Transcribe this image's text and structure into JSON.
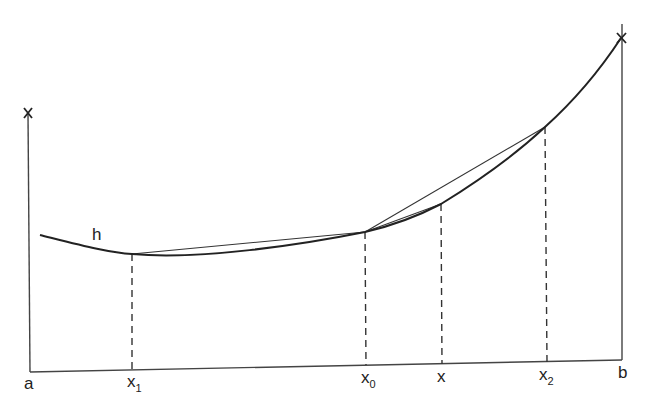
{
  "diagram": {
    "curve_label": "h",
    "y_axis_label": "x",
    "x_labels": {
      "a": "a",
      "x1_base": "x",
      "x1_sub": "1",
      "x0_base": "x",
      "x0_sub": "0",
      "x": "x",
      "x2_base": "x",
      "x2_sub": "2",
      "b": "b"
    },
    "points": [
      {
        "name": "x1",
        "px": 132,
        "curve_y": 254
      },
      {
        "name": "x0",
        "px": 365,
        "curve_y": 232
      },
      {
        "name": "x",
        "px": 441,
        "curve_y": 204
      },
      {
        "name": "x2",
        "px": 545,
        "curve_y": 127
      }
    ],
    "chords": [
      {
        "from": "x1",
        "to": "x0"
      },
      {
        "from": "x0",
        "to": "x2"
      },
      {
        "from": "x0",
        "to": "x"
      }
    ],
    "colors": {
      "line": "#222222",
      "background": "#ffffff"
    }
  }
}
